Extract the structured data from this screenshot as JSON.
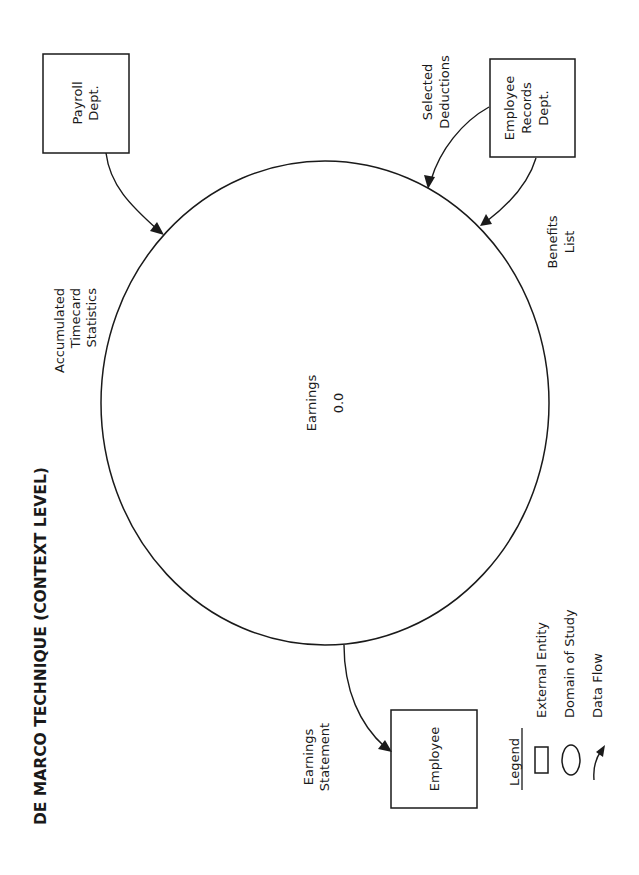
{
  "title": "DE MARCO TECHNIQUE (CONTEXT LEVEL)",
  "process": {
    "lines": [
      "Earnings",
      "0.0"
    ]
  },
  "entities": [
    {
      "id": "payroll",
      "lines": [
        "Payroll",
        "Dept."
      ]
    },
    {
      "id": "employee-records",
      "lines": [
        "Employee",
        "Records",
        "Dept."
      ]
    },
    {
      "id": "employee",
      "lines": [
        "Employee"
      ]
    }
  ],
  "flows": [
    {
      "id": "accumulated-timecard-statistics",
      "from": "Payroll Dept.",
      "to": "Earnings",
      "lines": [
        "Accumulated",
        "Timecard",
        "Statistics"
      ]
    },
    {
      "id": "selected-deductions",
      "from": "Employee Records Dept.",
      "to": "Earnings",
      "lines": [
        "Selected",
        "Deductions"
      ]
    },
    {
      "id": "benefits-list",
      "from": "Employee Records Dept.",
      "to": "Earnings",
      "lines": [
        "Benefits",
        "List"
      ]
    },
    {
      "id": "earnings-statement",
      "from": "Earnings",
      "to": "Employee",
      "lines": [
        "Earnings",
        "Statement"
      ]
    }
  ],
  "legend": {
    "heading": "Legend",
    "items": [
      {
        "symbol": "rectangle-icon",
        "label": "External Entity"
      },
      {
        "symbol": "ellipse-icon",
        "label": "Domain of Study"
      },
      {
        "symbol": "arrow-icon",
        "label": "Data Flow"
      }
    ]
  }
}
